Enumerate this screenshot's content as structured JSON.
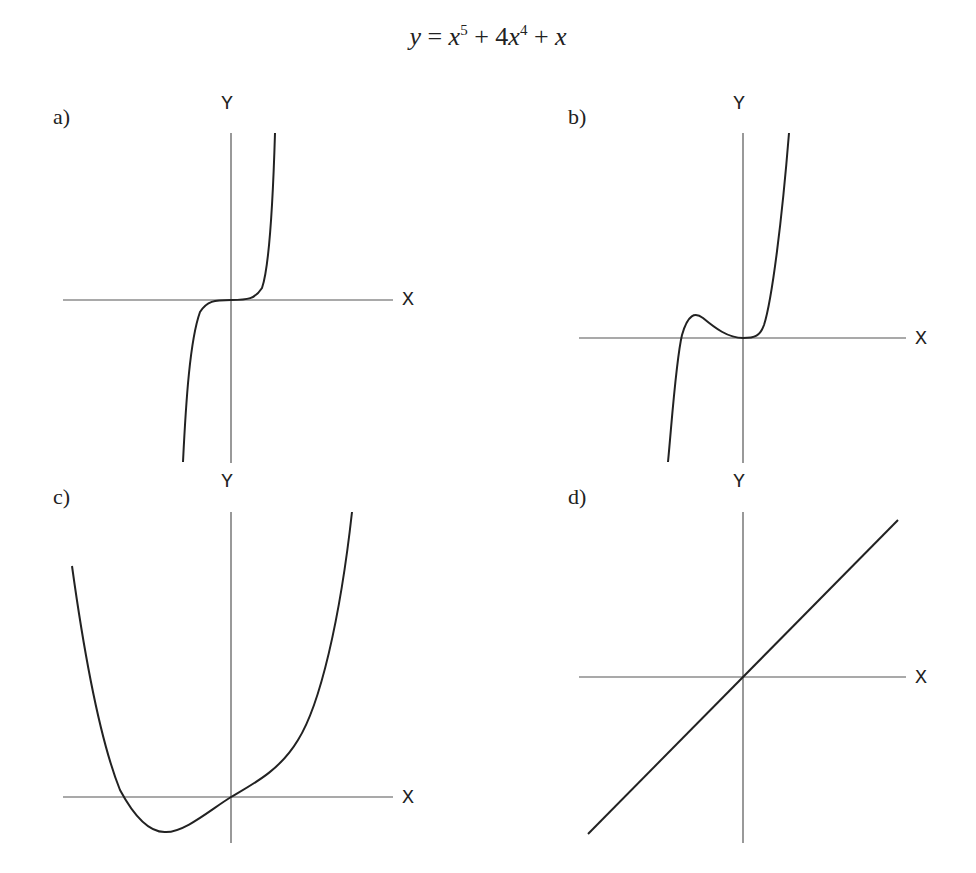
{
  "title": {
    "text": "y = x^5 + 4x^4 + x",
    "y": "y",
    "eq": "=",
    "x1": "x",
    "e1": "5",
    "plus1": "+",
    "c4": "4",
    "x2": "x",
    "e2": "4",
    "plus2": "+",
    "x3": "x"
  },
  "panels": [
    {
      "label": "a)",
      "xaxis": "X",
      "yaxis": "Y"
    },
    {
      "label": "b)",
      "xaxis": "X",
      "yaxis": "Y"
    },
    {
      "label": "c)",
      "xaxis": "X",
      "yaxis": "Y"
    },
    {
      "label": "d)",
      "xaxis": "X",
      "yaxis": "Y"
    }
  ],
  "colors": {
    "line": "#222222",
    "axis": "#555555",
    "background": "#ffffff"
  }
}
